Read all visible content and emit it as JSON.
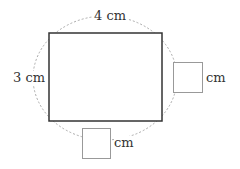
{
  "diagram": {
    "rectangle": {
      "width_label": "4 cm",
      "height_label": "3 cm"
    },
    "answer_boxes": [
      {
        "position": "right",
        "unit": "cm",
        "value": ""
      },
      {
        "position": "bottom",
        "unit": "cm",
        "value": ""
      }
    ],
    "colors": {
      "rect_stroke": "#333333",
      "dashed_curve": "#aaaaaa",
      "box_stroke": "#999999"
    }
  }
}
